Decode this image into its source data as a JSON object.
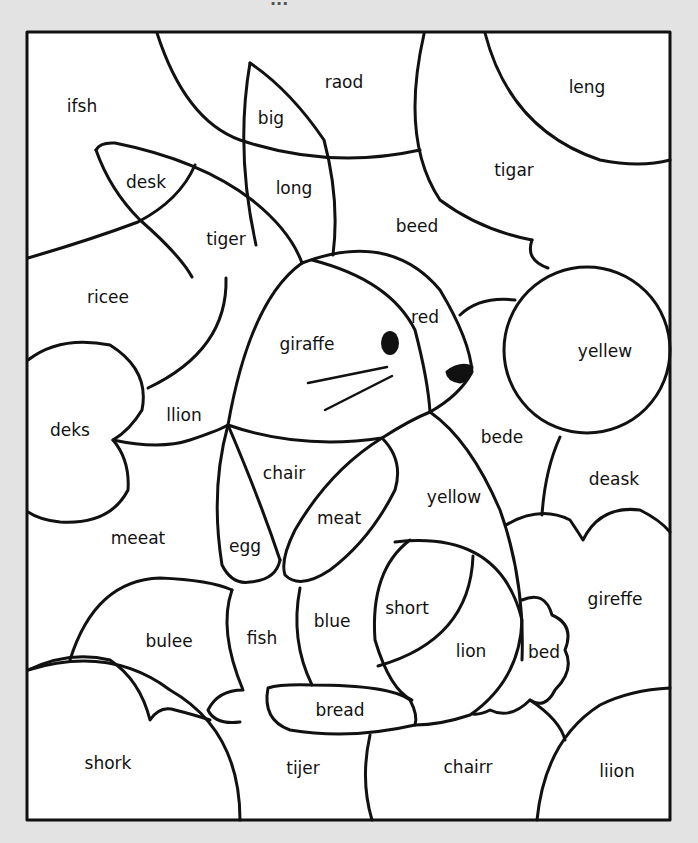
{
  "page": {
    "header_partial": "...",
    "background": "#e3e3e3",
    "frame_color": "#111111"
  },
  "regions": [
    {
      "id": "ifsh",
      "label": "ifsh",
      "x": 82,
      "y": 106
    },
    {
      "id": "raod",
      "label": "raod",
      "x": 344,
      "y": 82
    },
    {
      "id": "leng",
      "label": "leng",
      "x": 587,
      "y": 87
    },
    {
      "id": "big",
      "label": "big",
      "x": 271,
      "y": 118
    },
    {
      "id": "desk",
      "label": "desk",
      "x": 146,
      "y": 182
    },
    {
      "id": "long",
      "label": "long",
      "x": 294,
      "y": 188
    },
    {
      "id": "tigar",
      "label": "tigar",
      "x": 514,
      "y": 170
    },
    {
      "id": "tiger",
      "label": "tiger",
      "x": 226,
      "y": 239
    },
    {
      "id": "beed",
      "label": "beed",
      "x": 417,
      "y": 226
    },
    {
      "id": "ricee",
      "label": "ricee",
      "x": 108,
      "y": 297
    },
    {
      "id": "red",
      "label": "red",
      "x": 425,
      "y": 317
    },
    {
      "id": "giraffe",
      "label": "giraffe",
      "x": 307,
      "y": 344
    },
    {
      "id": "yellew",
      "label": "yellew",
      "x": 605,
      "y": 351
    },
    {
      "id": "deks",
      "label": "deks",
      "x": 70,
      "y": 430
    },
    {
      "id": "llion",
      "label": "llion",
      "x": 184,
      "y": 415
    },
    {
      "id": "bede",
      "label": "bede",
      "x": 502,
      "y": 437
    },
    {
      "id": "chair",
      "label": "chair",
      "x": 284,
      "y": 473
    },
    {
      "id": "deask",
      "label": "deask",
      "x": 614,
      "y": 479
    },
    {
      "id": "yellow",
      "label": "yellow",
      "x": 454,
      "y": 497
    },
    {
      "id": "meat",
      "label": "meat",
      "x": 339,
      "y": 518
    },
    {
      "id": "meeat",
      "label": "meeat",
      "x": 138,
      "y": 538
    },
    {
      "id": "egg",
      "label": "egg",
      "x": 245,
      "y": 546
    },
    {
      "id": "gireffe",
      "label": "gireffe",
      "x": 615,
      "y": 599
    },
    {
      "id": "short",
      "label": "short",
      "x": 407,
      "y": 608
    },
    {
      "id": "bulee",
      "label": "bulee",
      "x": 169,
      "y": 641
    },
    {
      "id": "fish",
      "label": "fish",
      "x": 262,
      "y": 638
    },
    {
      "id": "blue",
      "label": "blue",
      "x": 332,
      "y": 621
    },
    {
      "id": "lion",
      "label": "lion",
      "x": 471,
      "y": 651
    },
    {
      "id": "bed",
      "label": "bed",
      "x": 544,
      "y": 652
    },
    {
      "id": "bread",
      "label": "bread",
      "x": 340,
      "y": 710
    },
    {
      "id": "shork",
      "label": "shork",
      "x": 108,
      "y": 763
    },
    {
      "id": "tijer",
      "label": "tijer",
      "x": 303,
      "y": 768
    },
    {
      "id": "chairr",
      "label": "chairr",
      "x": 468,
      "y": 767
    },
    {
      "id": "liion",
      "label": "liion",
      "x": 617,
      "y": 771
    }
  ]
}
